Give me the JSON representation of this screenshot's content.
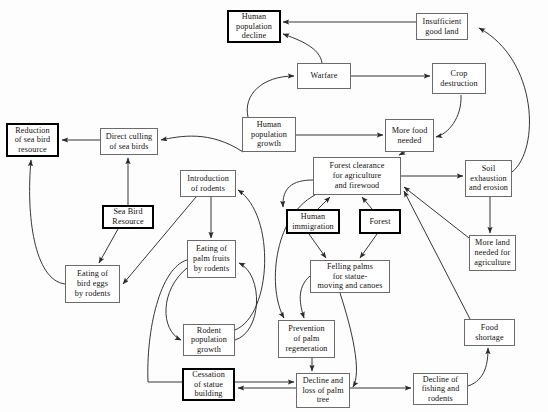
{
  "diagram": {
    "type": "causal-flow-diagram",
    "background_color": "#fdfdfd",
    "node_fill": "#ffffff",
    "node_border_color": "#6b6b6b",
    "emphasis_border_color": "#000000",
    "arrow_color": "#2b2b2b",
    "nodes": [
      {
        "id": "human-population-decline",
        "label": "Human\npopulation\ndecline",
        "x": 227,
        "y": 10,
        "w": 54,
        "h": 33,
        "emphasis": true
      },
      {
        "id": "insufficient-good-land",
        "label": "Insufficient\ngood land",
        "x": 416,
        "y": 13,
        "w": 52,
        "h": 27,
        "emphasis": false
      },
      {
        "id": "warfare",
        "label": "Warfare",
        "x": 297,
        "y": 63,
        "w": 54,
        "h": 26,
        "emphasis": false
      },
      {
        "id": "crop-destruction",
        "label": "Crop\ndestruction",
        "x": 432,
        "y": 63,
        "w": 54,
        "h": 31,
        "emphasis": false
      },
      {
        "id": "reduction-of-sea-bird-resource",
        "label": "Reduction\nof sea bird\nresource",
        "x": 6,
        "y": 123,
        "w": 53,
        "h": 34,
        "emphasis": true
      },
      {
        "id": "direct-culling-of-sea-birds",
        "label": "Direct culling\nof sea birds",
        "x": 100,
        "y": 128,
        "w": 58,
        "h": 27,
        "emphasis": false
      },
      {
        "id": "human-population-growth",
        "label": "Human\npopulation\ngrowth",
        "x": 242,
        "y": 117,
        "w": 54,
        "h": 35,
        "emphasis": false
      },
      {
        "id": "more-food-needed",
        "label": "More food\nneeded",
        "x": 385,
        "y": 119,
        "w": 49,
        "h": 33,
        "emphasis": false
      },
      {
        "id": "forest-clearance",
        "label": "Forest clearance\nfor agriculture\nand firewood",
        "x": 313,
        "y": 157,
        "w": 88,
        "h": 38,
        "emphasis": false
      },
      {
        "id": "soil-exhaustion-and-erosion",
        "label": "Soil\nexhaustion\nand erosion",
        "x": 465,
        "y": 160,
        "w": 47,
        "h": 37,
        "emphasis": false
      },
      {
        "id": "introduction-of-rodents",
        "label": "Introduction\nof rodents",
        "x": 180,
        "y": 170,
        "w": 56,
        "h": 27,
        "emphasis": false
      },
      {
        "id": "sea-bird-resource",
        "label": "Sea Bird\nResource",
        "x": 102,
        "y": 205,
        "w": 52,
        "h": 24,
        "emphasis": true
      },
      {
        "id": "human-immigration",
        "label": "Human\nimmigration",
        "x": 286,
        "y": 209,
        "w": 54,
        "h": 25,
        "emphasis": true
      },
      {
        "id": "forest",
        "label": "Forest",
        "x": 359,
        "y": 209,
        "w": 42,
        "h": 25,
        "emphasis": true
      },
      {
        "id": "more-land-needed-for-agriculture",
        "label": "More land\nneeded for\nagriculture",
        "x": 469,
        "y": 235,
        "w": 47,
        "h": 36,
        "emphasis": false
      },
      {
        "id": "eating-of-palm-fruits-by-rodents",
        "label": "Eating of\npalm fruits\nby rodents",
        "x": 187,
        "y": 240,
        "w": 49,
        "h": 38,
        "emphasis": false
      },
      {
        "id": "felling-palms",
        "label": "Felling palms\nfor statue-\nmoving and canoes",
        "x": 310,
        "y": 260,
        "w": 80,
        "h": 33,
        "emphasis": false
      },
      {
        "id": "eating-of-bird-eggs-by-rodents",
        "label": "Eating of\nbird eggs\nby rodents",
        "x": 65,
        "y": 265,
        "w": 55,
        "h": 38,
        "emphasis": false
      },
      {
        "id": "food-shortage",
        "label": "Food\nshortage",
        "x": 464,
        "y": 319,
        "w": 51,
        "h": 27,
        "emphasis": false
      },
      {
        "id": "prevention-of-palm-regeneration",
        "label": "Prevention\nof palm\nregeneration",
        "x": 278,
        "y": 320,
        "w": 57,
        "h": 38,
        "emphasis": false
      },
      {
        "id": "rodent-population-growth",
        "label": "Rodent\npopulation\ngrowth",
        "x": 183,
        "y": 324,
        "w": 52,
        "h": 32,
        "emphasis": false
      },
      {
        "id": "cessation-of-statue-building",
        "label": "Cessation\nof statue\nbuilding",
        "x": 182,
        "y": 368,
        "w": 53,
        "h": 33,
        "emphasis": true
      },
      {
        "id": "decline-and-loss-of-palm-tree",
        "label": "Decline and\nloss of palm\ntree",
        "x": 296,
        "y": 373,
        "w": 54,
        "h": 35,
        "emphasis": false
      },
      {
        "id": "decline-of-fishing-and-rodents",
        "label": "Decline of\nfishing and\nrodents",
        "x": 413,
        "y": 373,
        "w": 55,
        "h": 32,
        "emphasis": false
      }
    ],
    "edges": [
      {
        "id": "edge-insufficient-to-decline",
        "from": "insufficient-good-land",
        "to": "human-population-decline",
        "path": "M 416 22 L 283 22"
      },
      {
        "id": "edge-warfare-to-decline",
        "from": "warfare",
        "to": "human-population-decline",
        "path": "M 322 63 C 320 48 300 40 283 34"
      },
      {
        "id": "edge-warfare-to-crop",
        "from": "warfare",
        "to": "crop-destruction",
        "path": "M 351 76 L 430 76"
      },
      {
        "id": "edge-growth-to-warfare",
        "from": "human-population-growth",
        "to": "warfare",
        "path": "M 248 117 C 243 95 262 76 294 76"
      },
      {
        "id": "edge-crop-to-morefood",
        "from": "crop-destruction",
        "to": "more-food-needed",
        "path": "M 461 95 C 462 118 448 134 436 137"
      },
      {
        "id": "edge-growth-to-morefood",
        "from": "human-population-growth",
        "to": "more-food-needed",
        "path": "M 296 135 L 383 135"
      },
      {
        "id": "edge-morefood-to-clearance",
        "from": "more-food-needed",
        "to": "forest-clearance",
        "path": "M 405 152 L 399 155"
      },
      {
        "id": "edge-clearance-to-soil",
        "from": "forest-clearance",
        "to": "soil-exhaustion-and-erosion",
        "path": "M 401 176 L 463 176"
      },
      {
        "id": "edge-soil-to-insufficient",
        "from": "soil-exhaustion-and-erosion",
        "to": "insufficient-good-land",
        "path": "M 512 172 C 540 150 538 60 479 28"
      },
      {
        "id": "edge-soil-to-moreland",
        "from": "soil-exhaustion-and-erosion",
        "to": "more-land-needed-for-agriculture",
        "path": "M 490 197 L 490 233"
      },
      {
        "id": "edge-moreland-to-clearance",
        "from": "more-land-needed-for-agriculture",
        "to": "forest-clearance",
        "path": "M 469 238 L 404 187"
      },
      {
        "id": "edge-foodshortage-to-clearance",
        "from": "food-shortage",
        "to": "forest-clearance",
        "path": "M 470 319 L 404 191"
      },
      {
        "id": "edge-immigration-to-clearance",
        "from": "human-immigration",
        "to": "forest-clearance",
        "path": "M 318 209 L 330 197"
      },
      {
        "id": "edge-forest-to-clearance",
        "from": "forest",
        "to": "forest-clearance",
        "path": "M 372 209 L 362 197"
      },
      {
        "id": "edge-clearance-to-immigrationarea",
        "from": "forest-clearance",
        "to": "human-immigration",
        "path": "M 313 180 C 292 180 282 188 283 207"
      },
      {
        "id": "edge-immigration-to-felling",
        "from": "human-immigration",
        "to": "felling-palms",
        "path": "M 309 234 L 326 258"
      },
      {
        "id": "edge-forest-to-felling",
        "from": "forest",
        "to": "felling-palms",
        "path": "M 377 234 L 360 258"
      },
      {
        "id": "edge-growth-to-culling",
        "from": "human-population-growth",
        "to": "direct-culling-of-sea-birds",
        "path": "M 243 152 C 210 130 180 136 161 140"
      },
      {
        "id": "edge-culling-to-reduction",
        "from": "direct-culling-of-sea-birds",
        "to": "reduction-of-sea-bird-resource",
        "path": "M 100 140 L 62 140"
      },
      {
        "id": "edge-seabird-to-culling",
        "from": "sea-bird-resource",
        "to": "direct-culling-of-sea-birds",
        "path": "M 128 205 L 128 158"
      },
      {
        "id": "edge-seabird-to-eggs",
        "from": "sea-bird-resource",
        "to": "eating-of-bird-eggs-by-rodents",
        "path": "M 118 229 L 99 263"
      },
      {
        "id": "edge-introduction-to-eggs",
        "from": "introduction-of-rodents",
        "to": "eating-of-bird-eggs-by-rodents",
        "path": "M 196 197 L 123 284"
      },
      {
        "id": "edge-eggs-to-reduction",
        "from": "eating-of-bird-eggs-by-rodents",
        "to": "reduction-of-sea-bird-resource",
        "path": "M 65 284 C 34 280 26 215 31 160"
      },
      {
        "id": "edge-introduction-to-palmfruits",
        "from": "introduction-of-rodents",
        "to": "eating-of-palm-fruits-by-rodents",
        "path": "M 211 197 L 211 238"
      },
      {
        "id": "edge-palmfruits-to-rodentgrowth",
        "from": "eating-of-palm-fruits-by-rodents",
        "to": "rodent-population-growth",
        "path": "M 187 268 C 160 290 160 330 181 340"
      },
      {
        "id": "edge-rodentgrowth-to-palmfruits",
        "from": "rodent-population-growth",
        "to": "eating-of-palm-fruits-by-rodents",
        "path": "M 235 340 C 262 332 264 275 239 263"
      },
      {
        "id": "edge-rodentgrowth-to-introduction",
        "from": "rodent-population-growth",
        "to": "introduction-of-rodents",
        "path": "M 235 330 C 272 315 276 215 238 190"
      },
      {
        "id": "edge-felling-to-prevention",
        "from": "felling-palms",
        "to": "prevention-of-palm-regeneration",
        "path": "M 310 276 C 296 288 300 305 304 318"
      },
      {
        "id": "edge-clearance-to-prevention",
        "from": "forest-clearance",
        "to": "prevention-of-palm-regeneration",
        "path": "M 315 195 C 272 218 268 290 284 318"
      },
      {
        "id": "edge-prevention-to-decline",
        "from": "prevention-of-palm-regeneration",
        "to": "decline-and-loss-of-palm-tree",
        "path": "M 312 358 L 312 371"
      },
      {
        "id": "edge-felling-to-declinepalm",
        "from": "felling-palms",
        "to": "decline-and-loss-of-palm-tree",
        "path": "M 340 293 C 352 330 362 372 353 387"
      },
      {
        "id": "edge-decline-to-cessation",
        "from": "decline-and-loss-of-palm-tree",
        "to": "cessation-of-statue-building",
        "path": "M 296 388 L 238 388"
      },
      {
        "id": "edge-decline-to-fishing",
        "from": "decline-and-loss-of-palm-tree",
        "to": "decline-of-fishing-and-rodents",
        "path": "M 350 388 L 411 388"
      },
      {
        "id": "edge-fishing-to-foodshortage",
        "from": "decline-of-fishing-and-rodents",
        "to": "food-shortage",
        "path": "M 468 386 C 486 380 488 362 488 348"
      },
      {
        "id": "edge-palmfruits-to-declinepalm",
        "from": "eating-of-palm-fruits-by-rodents",
        "to": "decline-and-loss-of-palm-tree",
        "path": "M 187 260 C 160 268 146 330 148 382 L 294 382"
      }
    ]
  }
}
